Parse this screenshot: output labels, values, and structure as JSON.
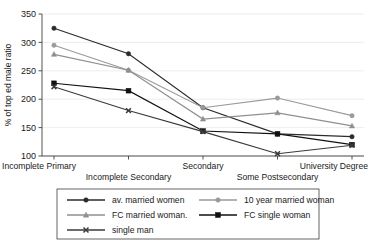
{
  "chart_data": {
    "type": "line",
    "title": "",
    "xlabel": "",
    "ylabel": "% of top ed male ratio",
    "ylim": [
      100,
      350
    ],
    "yticks": [
      100,
      150,
      200,
      250,
      300,
      350
    ],
    "grid": true,
    "legend_position": "bottom",
    "categories": [
      "Incomplete Primary",
      "Incomplete Secondary",
      "Secondary",
      "Some Postsecondary",
      "University Degree"
    ],
    "series": [
      {
        "name": "av. married women",
        "marker": "circle",
        "color": "#2b2b2b",
        "values": [
          325,
          280,
          185,
          139,
          134
        ]
      },
      {
        "name": "10 year married woman",
        "marker": "circle",
        "color": "#9a9a9a",
        "values": [
          295,
          251,
          185,
          202,
          171
        ]
      },
      {
        "name": "FC married woman.",
        "marker": "triangle",
        "color": "#8f8f8f",
        "values": [
          279,
          251,
          165,
          176,
          153
        ]
      },
      {
        "name": "FC single woman",
        "marker": "square",
        "color": "#111111",
        "values": [
          228,
          215,
          144,
          139,
          120
        ]
      },
      {
        "name": "single man",
        "marker": "x",
        "color": "#3a3a3a",
        "values": [
          222,
          180,
          143,
          104,
          119
        ]
      }
    ]
  },
  "legend": {
    "entries": [
      "av. married women",
      "10 year married woman",
      "FC married woman.",
      "FC single woman",
      "single man"
    ]
  },
  "axis": {
    "y_label": "% of top ed male ratio",
    "y_ticks": [
      "100",
      "150",
      "200",
      "250",
      "300",
      "350"
    ],
    "x_ticks": [
      "Incomplete Primary",
      "Incomplete Secondary",
      "Secondary",
      "Some Postsecondary",
      "University Degree"
    ]
  }
}
